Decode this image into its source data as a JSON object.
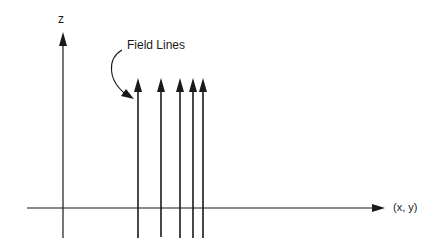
{
  "diagram": {
    "axes": {
      "vertical_label": "z",
      "horizontal_label": "(x, y)"
    },
    "annotation": {
      "label": "Field Lines"
    },
    "field_lines": {
      "count": 5,
      "direction": "up",
      "x_positions": [
        138,
        161,
        180,
        193,
        203
      ]
    },
    "colors": {
      "stroke": "#1a1a1a",
      "background": "#ffffff"
    }
  }
}
